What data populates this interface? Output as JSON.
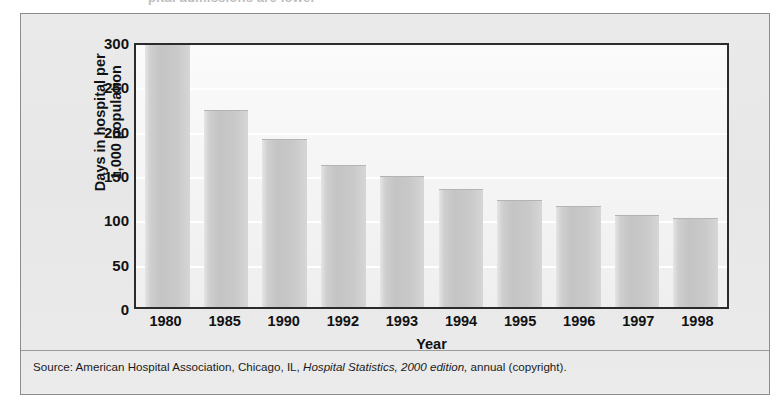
{
  "figure": {
    "cutoff_title": "pital admissions are lower",
    "y_axis_title": "Days in hospital per\n1,000 population",
    "x_axis_title": "Year",
    "source_prefix": "Source: American Hospital Association, Chicago, IL, ",
    "source_italic_1": "Hospital Statistics,",
    "source_italic_2": " 2000 edition,",
    "source_suffix": " annual (copyright)."
  },
  "chart_data": {
    "type": "bar",
    "title": "",
    "xlabel": "Year",
    "ylabel": "Days in hospital per 1,000 population",
    "categories": [
      "1980",
      "1985",
      "1990",
      "1992",
      "1993",
      "1994",
      "1995",
      "1996",
      "1997",
      "1998"
    ],
    "values": [
      300,
      224,
      191,
      161,
      149,
      134,
      121,
      115,
      104,
      101
    ],
    "ylim": [
      0,
      300
    ],
    "yticks": [
      0,
      50,
      100,
      150,
      200,
      250,
      300
    ],
    "gridlines": [
      50,
      100,
      150,
      200,
      250
    ],
    "grid": true,
    "legend": "none",
    "bar_color": "#c7c7c7",
    "plot_background": "#f6f6f6",
    "axis_color": "#2b2b2b"
  }
}
